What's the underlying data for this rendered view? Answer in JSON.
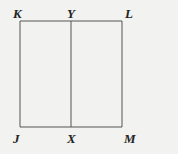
{
  "diagram": {
    "type": "geometry",
    "shape": "rectangle",
    "points": [
      {
        "name": "K",
        "label": "K",
        "x": 20,
        "y": 21,
        "lx": 13,
        "ly": 18
      },
      {
        "name": "Y",
        "label": "Y",
        "x": 71,
        "y": 21,
        "lx": 67,
        "ly": 18
      },
      {
        "name": "L",
        "label": "L",
        "x": 122,
        "y": 21,
        "lx": 125,
        "ly": 18
      },
      {
        "name": "J",
        "label": "J",
        "x": 20,
        "y": 127,
        "lx": 13,
        "ly": 143
      },
      {
        "name": "X",
        "label": "X",
        "x": 71,
        "y": 127,
        "lx": 67,
        "ly": 143
      },
      {
        "name": "M",
        "label": "M",
        "x": 122,
        "y": 127,
        "lx": 124,
        "ly": 143
      }
    ],
    "segments": [
      [
        "K",
        "L"
      ],
      [
        "L",
        "M"
      ],
      [
        "M",
        "J"
      ],
      [
        "J",
        "K"
      ],
      [
        "Y",
        "X"
      ]
    ],
    "line_color": "#555555"
  }
}
